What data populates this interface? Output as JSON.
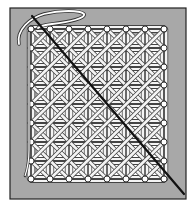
{
  "illustration": {
    "subject": "hand-caning weave pattern on a frame",
    "background_color": "#ffffff",
    "frame": {
      "x": 10,
      "y": 8,
      "width": 176,
      "height": 191,
      "fill": "#a8a8a8",
      "stroke": "#222222"
    },
    "grid": {
      "columns_x": [
        31,
        50,
        69,
        88,
        107,
        126,
        145,
        164
      ],
      "rows_y": [
        29,
        48,
        67,
        85,
        104,
        123,
        142,
        161,
        179
      ],
      "hole_fill": "#ffffff",
      "hole_stroke": "#333333",
      "hole_radius": 3
    },
    "panel": {
      "fill": "#ffffff"
    },
    "cane": {
      "fill": "#f4f4f4",
      "stroke": "#444444",
      "width": 3.2
    },
    "needle_strand": {
      "x1": 32,
      "y1": 16,
      "x2": 184,
      "y2": 194,
      "color": "#111111"
    },
    "loop_thread": {
      "color": "#ffffff",
      "stroke": "#333333"
    }
  }
}
